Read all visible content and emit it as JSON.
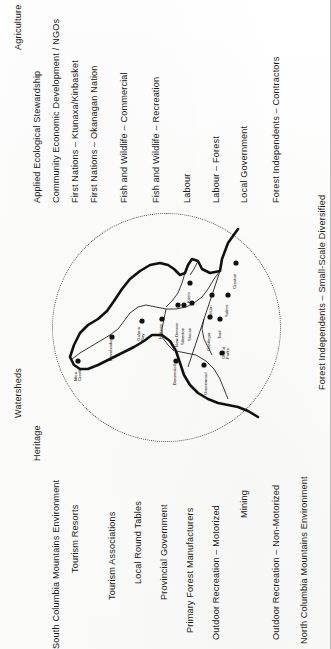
{
  "diagram": {
    "orientation": "labels-rotated-90-ccw",
    "circle": {
      "style": "dotted",
      "color": "#4a4a4a",
      "label": "region-of-interest-circle"
    }
  },
  "sectors": [
    {
      "id": "agriculture",
      "label": "Agriculture"
    },
    {
      "id": "watersheds",
      "label": "Watersheds"
    },
    {
      "id": "applied-eco",
      "label": "Applied Ecological Stewardship"
    },
    {
      "id": "heritage",
      "label": "Heritage"
    },
    {
      "id": "ced-ngos",
      "label": "Community Economic Development / NGOs"
    },
    {
      "id": "scme",
      "label": "South Columbia Mountains Environment"
    },
    {
      "id": "fn-ktunaxa",
      "label": "First Nations – Ktunaxa/Kinbasket"
    },
    {
      "id": "tourism-resorts",
      "label": "Tourism Resorts"
    },
    {
      "id": "fn-okanagan",
      "label": "First Nations – Okanagan Nation"
    },
    {
      "id": "tourism-assoc",
      "label": "Tourism Associations"
    },
    {
      "id": "fw-commercial",
      "label": "Fish and Wildlife – Commercial"
    },
    {
      "id": "local-round-tables",
      "label": "Local Round Tables"
    },
    {
      "id": "fw-recreation",
      "label": "Fish and Wildlife – Recreation"
    },
    {
      "id": "provincial-gov",
      "label": "Provincial Government"
    },
    {
      "id": "labour",
      "label": "Labour"
    },
    {
      "id": "primary-forest",
      "label": "Primary Forest Manufacturers"
    },
    {
      "id": "labour-forest",
      "label": "Labour – Forest"
    },
    {
      "id": "outdoor-motorized",
      "label": "Outdoor Recreation – Motorized"
    },
    {
      "id": "local-gov",
      "label": "Local Government"
    },
    {
      "id": "mining",
      "label": "Mining"
    },
    {
      "id": "fi-contractors",
      "label": "Forest Independents – Contractors"
    },
    {
      "id": "outdoor-nonmotor",
      "label": "Outdoor Recreation – Non-Motorized"
    },
    {
      "id": "ncme",
      "label": "North Columbia Mountains Environment"
    },
    {
      "id": "fi-small-scale",
      "label": "Forest Independents – Small-Scale Diversified"
    }
  ],
  "map": {
    "name": "kootenay-boundary-region-map",
    "cities": [
      {
        "id": "mica-creek",
        "label": "Mica Creek",
        "lines": [
          "Mica",
          "Creek"
        ]
      },
      {
        "id": "revelstoke",
        "label": "Revelstoke",
        "lines": [
          "Revelstoke"
        ]
      },
      {
        "id": "galena-bay",
        "label": "Galena Bay",
        "lines": [
          "Galena",
          "Bay"
        ]
      },
      {
        "id": "nakusp",
        "label": "Nakusp",
        "lines": [
          "Nakusp"
        ]
      },
      {
        "id": "kaslo",
        "label": "Kaslo",
        "lines": [
          "Kaslo"
        ]
      },
      {
        "id": "new-denver",
        "label": "New Denver",
        "lines": [
          "New Denver"
        ]
      },
      {
        "id": "silverton",
        "label": "Silverton",
        "lines": [
          "Silverton"
        ]
      },
      {
        "id": "slocan",
        "label": "Slocan",
        "lines": [
          "Slocan"
        ]
      },
      {
        "id": "nelson",
        "label": "Nelson",
        "lines": [
          "Nelson"
        ]
      },
      {
        "id": "creston",
        "label": "Creston",
        "lines": [
          "Creston"
        ]
      },
      {
        "id": "salmo",
        "label": "Salmo",
        "lines": [
          "Salmo"
        ]
      },
      {
        "id": "castlegar",
        "label": "Castlegar",
        "lines": [
          "Castlegar"
        ]
      },
      {
        "id": "trail",
        "label": "Trail",
        "lines": [
          "Trail"
        ]
      },
      {
        "id": "grand-forks",
        "label": "Grand Forks",
        "lines": [
          "Grand",
          "Forks"
        ]
      },
      {
        "id": "greenwood",
        "label": "Greenwood",
        "lines": [
          "Greenwood"
        ]
      },
      {
        "id": "beaverdell",
        "label": "Beaverdell",
        "lines": [
          "Beaverdell"
        ]
      }
    ]
  }
}
